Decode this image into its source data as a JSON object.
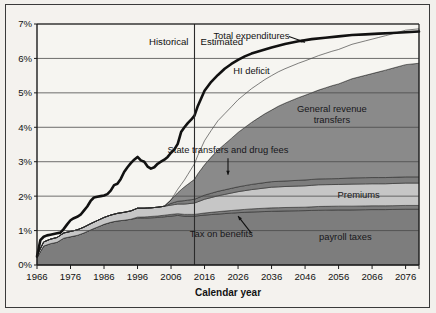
{
  "figure": {
    "xlabel": "Calendar year",
    "period_labels": {
      "historical": "Historical",
      "estimated": "Estimated",
      "divider_year": 2013
    }
  },
  "chart_data": {
    "type": "area",
    "title": "",
    "subtitle": "",
    "xlabel": "Calendar year",
    "ylabel": "",
    "xlim": [
      1966,
      2080
    ],
    "ylim": [
      0,
      7
    ],
    "grid": true,
    "legend_position": "inline-annotations",
    "xticks": [
      1966,
      1976,
      1986,
      1996,
      2006,
      2016,
      2026,
      2036,
      2046,
      2056,
      2066,
      2076
    ],
    "xtick_labels": [
      "1966",
      "1976",
      "1986",
      "1996",
      "2006",
      "2016",
      "2026",
      "2036",
      "2046",
      "2056",
      "2066",
      "2076"
    ],
    "yticks": [
      0,
      1,
      2,
      3,
      4,
      5,
      6,
      7
    ],
    "ytick_labels": [
      "0%",
      "1%",
      "2%",
      "3%",
      "4%",
      "5%",
      "6%",
      "7%"
    ],
    "annotations": [
      {
        "text": "Total expenditures",
        "x": 2030,
        "y": 6.55,
        "kind": "line-label"
      },
      {
        "text": "HI deficit",
        "x": 2030,
        "y": 5.55,
        "kind": "band-label"
      },
      {
        "text": "General revenue transfers",
        "x": 2054,
        "y": 4.45,
        "kind": "band-label"
      },
      {
        "text": "State transfers and drug fees",
        "x": 2023,
        "y": 3.25,
        "kind": "pointer-label"
      },
      {
        "text": "Premiums",
        "x": 2062,
        "y": 1.95,
        "kind": "band-label"
      },
      {
        "text": "Tax on benefits",
        "x": 2021,
        "y": 0.8,
        "kind": "pointer-label"
      },
      {
        "text": "payroll taxes",
        "x": 2058,
        "y": 0.72,
        "kind": "band-label"
      }
    ],
    "series": [
      {
        "name": "payroll taxes",
        "color": "#7d7d7d",
        "x": [
          1966,
          1968,
          1970,
          1972,
          1974,
          1976,
          1978,
          1980,
          1982,
          1984,
          1986,
          1988,
          1990,
          1992,
          1994,
          1996,
          1998,
          2000,
          2002,
          2004,
          2006,
          2008,
          2010,
          2013,
          2016,
          2020,
          2026,
          2030,
          2036,
          2040,
          2046,
          2050,
          2056,
          2060,
          2066,
          2070,
          2076,
          2080
        ],
        "values": [
          0.22,
          0.55,
          0.62,
          0.66,
          0.78,
          0.82,
          0.86,
          0.93,
          1.02,
          1.1,
          1.18,
          1.24,
          1.28,
          1.3,
          1.33,
          1.36,
          1.36,
          1.37,
          1.38,
          1.4,
          1.42,
          1.44,
          1.42,
          1.42,
          1.45,
          1.48,
          1.52,
          1.54,
          1.56,
          1.57,
          1.58,
          1.59,
          1.6,
          1.6,
          1.61,
          1.61,
          1.62,
          1.62
        ]
      },
      {
        "name": "Tax on benefits",
        "color": "#7d7d7d",
        "x": [
          1966,
          1994,
          1996,
          2000,
          2006,
          2010,
          2013,
          2016,
          2020,
          2026,
          2030,
          2036,
          2040,
          2046,
          2050,
          2056,
          2060,
          2066,
          2070,
          2076,
          2080
        ],
        "values": [
          0,
          0,
          0.03,
          0.04,
          0.05,
          0.05,
          0.05,
          0.06,
          0.07,
          0.08,
          0.09,
          0.1,
          0.1,
          0.1,
          0.11,
          0.11,
          0.11,
          0.11,
          0.11,
          0.11,
          0.11
        ]
      },
      {
        "name": "Premiums",
        "color": "#c6c6c6",
        "x": [
          1966,
          1968,
          1970,
          1974,
          1978,
          1982,
          1986,
          1990,
          1994,
          1996,
          2000,
          2004,
          2006,
          2008,
          2010,
          2013,
          2016,
          2020,
          2026,
          2030,
          2036,
          2040,
          2046,
          2050,
          2056,
          2060,
          2066,
          2070,
          2076,
          2080
        ],
        "values": [
          0.06,
          0.12,
          0.13,
          0.15,
          0.16,
          0.18,
          0.2,
          0.22,
          0.24,
          0.26,
          0.25,
          0.26,
          0.27,
          0.28,
          0.3,
          0.33,
          0.4,
          0.46,
          0.53,
          0.56,
          0.6,
          0.61,
          0.62,
          0.63,
          0.63,
          0.64,
          0.64,
          0.64,
          0.65,
          0.65
        ]
      },
      {
        "name": "State transfers and drug fees",
        "color": "#7d7d7d",
        "x": [
          1966,
          2004,
          2006,
          2008,
          2010,
          2013,
          2016,
          2020,
          2026,
          2030,
          2036,
          2040,
          2046,
          2050,
          2056,
          2060,
          2066,
          2070,
          2076,
          2080
        ],
        "values": [
          0,
          0,
          0.05,
          0.08,
          0.1,
          0.11,
          0.12,
          0.13,
          0.14,
          0.15,
          0.16,
          0.16,
          0.17,
          0.17,
          0.17,
          0.18,
          0.18,
          0.18,
          0.18,
          0.18
        ]
      },
      {
        "name": "General revenue transfers",
        "color": "#8a8a8a",
        "x": [
          1966,
          1990,
          2000,
          2004,
          2006,
          2008,
          2010,
          2012,
          2013,
          2014,
          2016,
          2018,
          2020,
          2024,
          2026,
          2030,
          2034,
          2036,
          2038,
          2040,
          2044,
          2046,
          2050,
          2054,
          2056,
          2060,
          2066,
          2070,
          2076,
          2080
        ],
        "values": [
          0,
          0,
          0,
          0,
          0.1,
          0.25,
          0.4,
          0.52,
          0.58,
          0.7,
          0.88,
          1.05,
          1.2,
          1.45,
          1.58,
          1.8,
          2.0,
          2.08,
          2.18,
          2.26,
          2.4,
          2.46,
          2.58,
          2.7,
          2.75,
          2.88,
          3.02,
          3.12,
          3.26,
          3.3
        ]
      },
      {
        "name": "HI deficit",
        "color": "#f6f5f1",
        "x": [
          1966,
          2006,
          2010,
          2013,
          2016,
          2020,
          2026,
          2030,
          2036,
          2040,
          2046,
          2050,
          2056,
          2060,
          2066,
          2070,
          2076,
          2080
        ],
        "values": [
          0,
          0,
          0.2,
          0.45,
          0.7,
          0.85,
          0.95,
          0.98,
          1.0,
          1.0,
          1.0,
          1.0,
          1.0,
          1.0,
          1.0,
          1.0,
          1.0,
          1.0
        ]
      }
    ],
    "total_expenditures": {
      "name": "Total expenditures",
      "color": "#111111",
      "x": [
        1966,
        1967,
        1968,
        1969,
        1970,
        1971,
        1972,
        1973,
        1974,
        1975,
        1976,
        1977,
        1978,
        1979,
        1980,
        1981,
        1982,
        1983,
        1984,
        1985,
        1986,
        1987,
        1988,
        1989,
        1990,
        1991,
        1992,
        1993,
        1994,
        1995,
        1996,
        1997,
        1998,
        1999,
        2000,
        2001,
        2002,
        2003,
        2004,
        2005,
        2006,
        2007,
        2008,
        2009,
        2010,
        2011,
        2012,
        2013,
        2014,
        2016,
        2018,
        2020,
        2022,
        2024,
        2026,
        2028,
        2030,
        2032,
        2034,
        2036,
        2040,
        2044,
        2048,
        2052,
        2056,
        2060,
        2064,
        2068,
        2072,
        2076,
        2080
      ],
      "values": [
        0.25,
        0.72,
        0.82,
        0.86,
        0.88,
        0.9,
        0.92,
        0.94,
        1.05,
        1.18,
        1.3,
        1.36,
        1.4,
        1.46,
        1.58,
        1.7,
        1.86,
        1.96,
        1.98,
        2.0,
        2.02,
        2.06,
        2.16,
        2.32,
        2.36,
        2.5,
        2.7,
        2.84,
        2.96,
        3.06,
        3.14,
        3.04,
        3.0,
        2.86,
        2.8,
        2.84,
        2.94,
        3.0,
        3.06,
        3.14,
        3.26,
        3.36,
        3.52,
        3.86,
        4.0,
        4.12,
        4.22,
        4.34,
        4.62,
        5.06,
        5.32,
        5.52,
        5.7,
        5.84,
        5.96,
        6.06,
        6.14,
        6.2,
        6.26,
        6.32,
        6.42,
        6.5,
        6.56,
        6.6,
        6.64,
        6.68,
        6.7,
        6.72,
        6.74,
        6.76,
        6.78
      ]
    }
  },
  "bleed_text": "Medicare and in this table\n\nthe information that show\n\nMedicare return carried out\n\nunder additional and cover\n\nwith approval of a premium obtained\n\nfrom one plan or one the\n\nelement of Part D a variety\n\nto require the expenditures\n\nfor the same drug required\n\nfor the expenditures\n\na comparable"
}
